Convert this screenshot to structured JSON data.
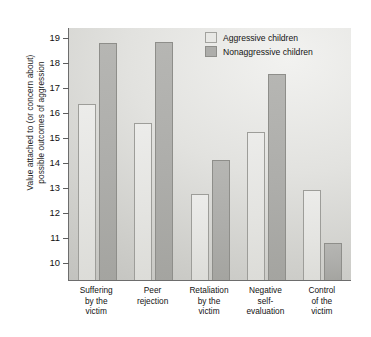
{
  "chart_data": {
    "type": "bar",
    "title": "",
    "xlabel": "",
    "ylabel": "Value attached to (or concern about)\npossible outcomes of aggression",
    "ylim": [
      9.3,
      19.4
    ],
    "yticks": [
      10,
      11,
      12,
      13,
      14,
      15,
      16,
      17,
      18,
      19
    ],
    "ytick_labels": [
      "10",
      "11",
      "12",
      "13",
      "14",
      "15",
      "16",
      "17",
      "18",
      "19"
    ],
    "grid": false,
    "legend_position": "top-right",
    "categories": [
      "Suffering\nby the\nvictim",
      "Peer\nrejection",
      "Retaliation\nby the\nvictim",
      "Negative\nself-\nevaluation",
      "Control\nof the\nvictim"
    ],
    "series": [
      {
        "name": "Aggressive children",
        "color": "#e4e4e1",
        "values": [
          16.35,
          15.6,
          12.75,
          15.25,
          12.9
        ]
      },
      {
        "name": "Nonaggressive children",
        "color": "#adadaa",
        "values": [
          18.8,
          18.85,
          14.1,
          17.55,
          10.8
        ]
      }
    ]
  },
  "legend": {
    "items": [
      {
        "label": "Aggressive children",
        "swatch": "light"
      },
      {
        "label": "Nonaggressive children",
        "swatch": "dark"
      }
    ]
  },
  "colors": {
    "light_bar": "#e4e4e1",
    "dark_bar": "#adadaa",
    "axis": "#6d6d6d",
    "text": "#111111",
    "plot_background": "#dcdcd9"
  }
}
